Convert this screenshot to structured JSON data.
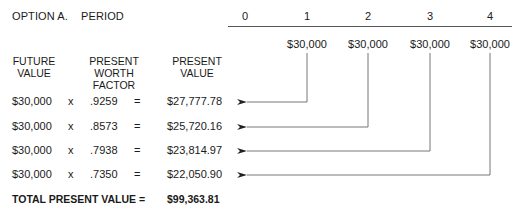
{
  "title": {
    "option": "OPTION A.",
    "period_label": "PERIOD"
  },
  "timeline": {
    "periods": [
      "0",
      "1",
      "2",
      "3",
      "4"
    ],
    "cash_flows": [
      "$30,000",
      "$30,000",
      "$30,000",
      "$30,000"
    ]
  },
  "headers": {
    "future_value": [
      "FUTURE",
      "VALUE"
    ],
    "pw_factor": [
      "PRESENT",
      "WORTH",
      "FACTOR"
    ],
    "present_value": [
      "PRESENT",
      "VALUE"
    ]
  },
  "rows": [
    {
      "future_value": "$30,000",
      "op": "x",
      "factor": ".9259",
      "eq": "=",
      "present_value": "$27,777.78",
      "period": "1"
    },
    {
      "future_value": "$30,000",
      "op": "x",
      "factor": ".8573",
      "eq": "=",
      "present_value": "$25,720.16",
      "period": "2"
    },
    {
      "future_value": "$30,000",
      "op": "x",
      "factor": ".7938",
      "eq": "=",
      "present_value": "$23,814.97",
      "period": "3"
    },
    {
      "future_value": "$30,000",
      "op": "x",
      "factor": ".7350",
      "eq": "=",
      "present_value": "$22,050.90",
      "period": "4"
    }
  ],
  "total": {
    "label": "TOTAL PRESENT VALUE =",
    "value": "$99,363.81"
  },
  "colors": {
    "text": "#1a1a1a",
    "lines": "#555555"
  }
}
